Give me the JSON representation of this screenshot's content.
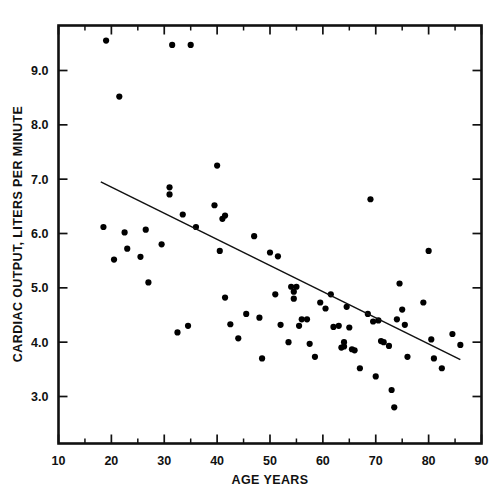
{
  "chart_data": {
    "type": "scatter",
    "title": "",
    "xlabel": "AGE YEARS",
    "ylabel": "CARDIAC OUTPUT, LITERS PER MINUTE",
    "xlim": [
      10,
      90
    ],
    "ylim": [
      2.3,
      9.9
    ],
    "grid": false,
    "legend": null,
    "x_ticks_major": [
      10,
      20,
      30,
      40,
      50,
      60,
      70,
      80,
      90
    ],
    "x_tick_labels": [
      "10",
      "20",
      "30",
      "40",
      "50",
      "60",
      "70",
      "80",
      "90"
    ],
    "x_ticks_minor": [
      15,
      25,
      35,
      45,
      55,
      65,
      75,
      85
    ],
    "y_ticks_major": [
      3.0,
      4.0,
      5.0,
      6.0,
      7.0,
      8.0,
      9.0
    ],
    "y_tick_labels": [
      "3.0",
      "4.0",
      "5.0",
      "6.0",
      "7.0",
      "8.0",
      "9.0"
    ],
    "points": [
      [
        19.0,
        9.55
      ],
      [
        21.5,
        8.52
      ],
      [
        31.5,
        9.47
      ],
      [
        35.0,
        9.47
      ],
      [
        18.5,
        6.12
      ],
      [
        20.5,
        5.52
      ],
      [
        22.5,
        6.02
      ],
      [
        23.0,
        5.72
      ],
      [
        25.5,
        5.57
      ],
      [
        26.5,
        6.07
      ],
      [
        27.0,
        5.1
      ],
      [
        29.5,
        5.8
      ],
      [
        31.0,
        6.85
      ],
      [
        31.0,
        6.72
      ],
      [
        32.5,
        4.18
      ],
      [
        33.5,
        6.35
      ],
      [
        34.5,
        4.3
      ],
      [
        36.0,
        6.12
      ],
      [
        39.5,
        6.52
      ],
      [
        40.0,
        7.25
      ],
      [
        40.5,
        5.68
      ],
      [
        41.0,
        6.27
      ],
      [
        41.5,
        6.33
      ],
      [
        41.5,
        4.82
      ],
      [
        42.5,
        4.33
      ],
      [
        44.0,
        4.07
      ],
      [
        45.5,
        4.52
      ],
      [
        47.0,
        5.95
      ],
      [
        48.0,
        4.45
      ],
      [
        48.5,
        3.7
      ],
      [
        50.0,
        5.65
      ],
      [
        51.0,
        4.88
      ],
      [
        51.5,
        5.58
      ],
      [
        52.0,
        4.32
      ],
      [
        53.5,
        4.0
      ],
      [
        54.0,
        5.02
      ],
      [
        54.5,
        4.93
      ],
      [
        54.5,
        4.8
      ],
      [
        55.0,
        5.02
      ],
      [
        55.5,
        4.3
      ],
      [
        56.0,
        4.42
      ],
      [
        57.0,
        4.42
      ],
      [
        57.5,
        3.97
      ],
      [
        58.5,
        3.73
      ],
      [
        59.5,
        4.73
      ],
      [
        60.5,
        4.62
      ],
      [
        61.5,
        4.88
      ],
      [
        62.0,
        4.28
      ],
      [
        63.0,
        4.3
      ],
      [
        63.5,
        3.9
      ],
      [
        64.0,
        4.0
      ],
      [
        64.0,
        3.92
      ],
      [
        64.5,
        4.65
      ],
      [
        65.0,
        4.27
      ],
      [
        65.5,
        3.87
      ],
      [
        66.0,
        3.85
      ],
      [
        67.0,
        3.52
      ],
      [
        68.5,
        4.52
      ],
      [
        69.0,
        6.63
      ],
      [
        69.5,
        4.38
      ],
      [
        70.0,
        3.37
      ],
      [
        70.5,
        4.4
      ],
      [
        71.0,
        4.02
      ],
      [
        71.5,
        4.0
      ],
      [
        72.5,
        3.93
      ],
      [
        73.0,
        3.12
      ],
      [
        73.5,
        2.8
      ],
      [
        74.0,
        4.42
      ],
      [
        74.5,
        5.08
      ],
      [
        75.0,
        4.6
      ],
      [
        75.5,
        4.32
      ],
      [
        76.0,
        3.73
      ],
      [
        79.0,
        4.73
      ],
      [
        80.0,
        5.68
      ],
      [
        80.5,
        4.05
      ],
      [
        81.0,
        3.7
      ],
      [
        82.5,
        3.52
      ],
      [
        84.5,
        4.15
      ],
      [
        86.0,
        3.95
      ]
    ],
    "fit_line": {
      "x_start": 18.0,
      "y_start": 6.95,
      "x_end": 86.0,
      "y_end": 3.68
    }
  }
}
